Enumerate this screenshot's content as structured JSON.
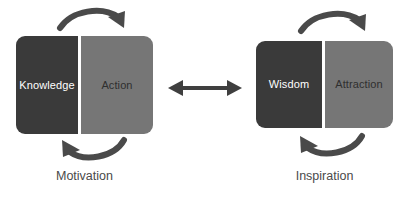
{
  "diagram": {
    "background_color": "#ffffff",
    "dark_panel_color": "#3a3a3a",
    "light_panel_color": "#767676",
    "arrow_color": "#4a4a4a",
    "dark_text_color": "#ffffff",
    "light_text_color": "#2f2f2f",
    "caption_color": "#4a4a4a"
  },
  "units": [
    {
      "id": "left",
      "dark_label": "Knowledge",
      "light_label": "Action",
      "caption": "Motivation",
      "top_arrow": "curved-arrow-clockwise-right",
      "bottom_arrow": "curved-arrow-counterclockwise-left"
    },
    {
      "id": "right",
      "dark_label": "Wisdom",
      "light_label": "Attraction",
      "caption": "Inspiration",
      "top_arrow": "curved-arrow-clockwise-right",
      "bottom_arrow": "curved-arrow-counterclockwise-left"
    }
  ],
  "connector": {
    "icon": "double-headed-arrow-horizontal",
    "label": ""
  }
}
